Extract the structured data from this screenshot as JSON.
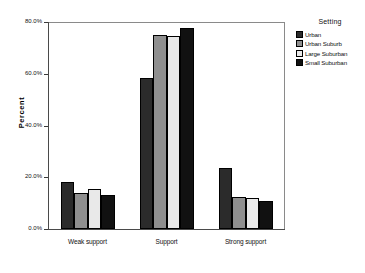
{
  "chart_data": {
    "type": "bar",
    "title": "",
    "xlabel": "",
    "ylabel": "Percent",
    "categories": [
      "Weak support",
      "Support",
      "Strong support"
    ],
    "series": [
      {
        "name": "Urban",
        "color": "#2b2b2b",
        "values": [
          18.0,
          58.5,
          23.5
        ]
      },
      {
        "name": "Urban Suburb",
        "color": "#8f8f8f",
        "values": [
          14.0,
          75.0,
          12.5
        ]
      },
      {
        "name": "Large Suburban",
        "color": "#e9e9e9",
        "values": [
          15.5,
          74.5,
          12.0
        ]
      },
      {
        "name": "Small Suburban",
        "color": "#111111",
        "values": [
          13.0,
          77.5,
          11.0
        ]
      }
    ],
    "ylim": [
      0,
      80
    ],
    "ytick_values": [
      0,
      20,
      40,
      60,
      80
    ],
    "ytick_labels": [
      "0.0%",
      "20.0%",
      "40.0%",
      "60.0%",
      "80.0%"
    ],
    "grid": false,
    "legend_position": "right",
    "legend_title": "Setting"
  },
  "legend": {
    "title": "Setting",
    "entries": [
      {
        "label": "Urban",
        "color": "#2b2b2b"
      },
      {
        "label": "Urban Suburb",
        "color": "#8f8f8f"
      },
      {
        "label": "Large Suburban",
        "color": "#e9e9e9"
      },
      {
        "label": "Small Suburban",
        "color": "#111111"
      }
    ]
  },
  "axes": {
    "y_title": "Percent",
    "y_labels": [
      "80.0%",
      "60.0%",
      "40.0%",
      "20.0%",
      "0.0%"
    ],
    "x_labels": [
      "Weak support",
      "Support",
      "Strong support"
    ]
  }
}
